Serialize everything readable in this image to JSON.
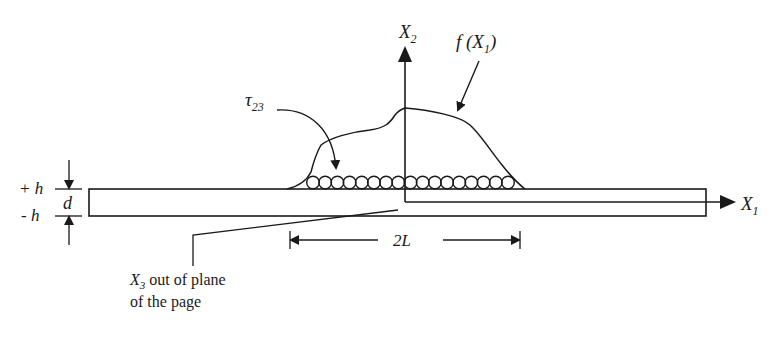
{
  "diagram": {
    "type": "cross-section",
    "labels": {
      "x2_axis": "X",
      "x2_sub": "2",
      "x1_axis": "X",
      "x1_sub": "1",
      "load_func": "f (X",
      "load_func_sub": "1",
      "load_func_close": ")",
      "shear": "τ",
      "shear_sub": "23",
      "plus_h": "+ h",
      "minus_h": "- h",
      "thickness": "d",
      "span": "2L",
      "x3_note_sym": "X",
      "x3_note_sub": "3",
      "x3_note_line1": " out of plane",
      "x3_note_line2": "of the page"
    },
    "elements": {
      "circle_count": 17,
      "colors": {
        "stroke": "#1a1a1a",
        "background": "#ffffff"
      }
    }
  }
}
